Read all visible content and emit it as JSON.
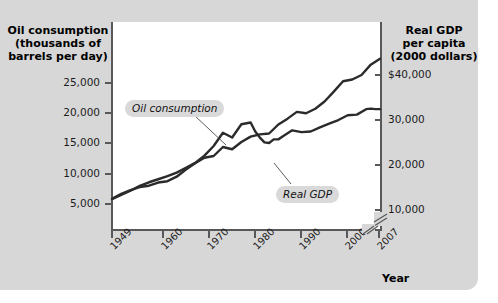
{
  "chart_data": {
    "type": "line",
    "title": "",
    "xlabel": "Year",
    "axes": {
      "x": {
        "label": "Year",
        "tick_labels": [
          "1949",
          "1960",
          "1970",
          "1980",
          "1990",
          "2000",
          "2007"
        ],
        "tick_values": [
          1949,
          1960,
          1970,
          1980,
          1990,
          2000,
          2007
        ],
        "range": [
          1949,
          2007
        ]
      },
      "y_left": {
        "label": "Oil consumption\n(thousands of\nbarrels per day)",
        "tick_labels": [
          "5,000",
          "10,000",
          "15,000",
          "20,000",
          "25,000"
        ],
        "tick_values": [
          5000,
          10000,
          15000,
          20000,
          25000
        ],
        "range": [
          0,
          30000
        ],
        "axis_break": false
      },
      "y_right": {
        "label": "Real GDP\nper capita\n(2000 dollars)",
        "tick_labels": [
          "10,000",
          "20,000",
          "30,000",
          "$40,000"
        ],
        "tick_values": [
          10000,
          20000,
          30000,
          40000
        ],
        "range": [
          0,
          45000
        ],
        "axis_break": true
      }
    },
    "grid": false,
    "legend_position": "inline-callouts",
    "annotations": [
      {
        "name": "oil-consumption-callout",
        "text": "Oil consumption",
        "points_to_series": "Oil consumption"
      },
      {
        "name": "real-gdp-callout",
        "text": "Real GDP",
        "points_to_series": "Real GDP"
      }
    ],
    "series": [
      {
        "name": "Oil consumption",
        "axis": "y_left",
        "units": "thousands of barrels per day",
        "color": "#2b2b2b",
        "x": [
          1949,
          1951,
          1953,
          1955,
          1957,
          1959,
          1961,
          1963,
          1965,
          1967,
          1969,
          1971,
          1973,
          1975,
          1977,
          1979,
          1980,
          1981,
          1982,
          1983,
          1984,
          1985,
          1986,
          1988,
          1990,
          1992,
          1994,
          1996,
          1998,
          2000,
          2002,
          2004,
          2005,
          2006,
          2007
        ],
        "values": [
          5800,
          6500,
          7200,
          8000,
          8600,
          9100,
          9600,
          10200,
          11000,
          11800,
          13000,
          14600,
          16800,
          16000,
          18200,
          18500,
          17000,
          16000,
          15200,
          15100,
          15700,
          15700,
          16200,
          17200,
          16900,
          17000,
          17700,
          18300,
          18900,
          19700,
          19800,
          20700,
          20800,
          20700,
          20700
        ],
        "start_value": 5800,
        "end_value": 20700,
        "notes": "Peaks around 1978-1979 near 18,500, dips to about 15,100 in 1983, then rises steadily"
      },
      {
        "name": "Real GDP",
        "axis": "y_right",
        "units": "2000 dollars per capita",
        "color": "#2b2b2b",
        "x": [
          1949,
          1951,
          1953,
          1955,
          1957,
          1959,
          1961,
          1963,
          1965,
          1967,
          1969,
          1971,
          1973,
          1975,
          1977,
          1979,
          1981,
          1983,
          1985,
          1987,
          1989,
          1991,
          1993,
          1995,
          1997,
          1999,
          2001,
          2003,
          2005,
          2007
        ],
        "values": [
          12500,
          13600,
          14400,
          15100,
          15400,
          16100,
          16400,
          17400,
          19000,
          20400,
          21600,
          22000,
          24000,
          23500,
          25100,
          26300,
          26800,
          27000,
          29000,
          30300,
          31800,
          31500,
          32500,
          34100,
          36300,
          38600,
          39000,
          40000,
          42300,
          43600
        ],
        "start_value": 12500,
        "end_value": 43600,
        "notes": "Smooth upward trend with small flattening near 1974-1975, 1982 and 1991 recessions"
      }
    ]
  },
  "axis_titles": {
    "left": "Oil consumption\n(thousands of\nbarrels per day)",
    "right": "Real GDP\nper capita\n(2000 dollars)",
    "x": "Year"
  },
  "left_ticks": [
    "25,000",
    "20,000",
    "15,000",
    "10,000",
    "5,000"
  ],
  "right_ticks": [
    "$40,000",
    "30,000",
    "20,000",
    "10,000"
  ],
  "x_ticks": [
    "1949",
    "1960",
    "1970",
    "1980",
    "1990",
    "2000",
    "2007"
  ],
  "callouts": {
    "oil": "Oil consumption",
    "gdp": "Real GDP"
  },
  "colors": {
    "panel_background": "#d7d7d7",
    "plot_background": "#ffffff",
    "axis": "#58585a",
    "series_line": "#2b2b2b",
    "callout_background": "#d9d9d9",
    "text": "#111111"
  }
}
